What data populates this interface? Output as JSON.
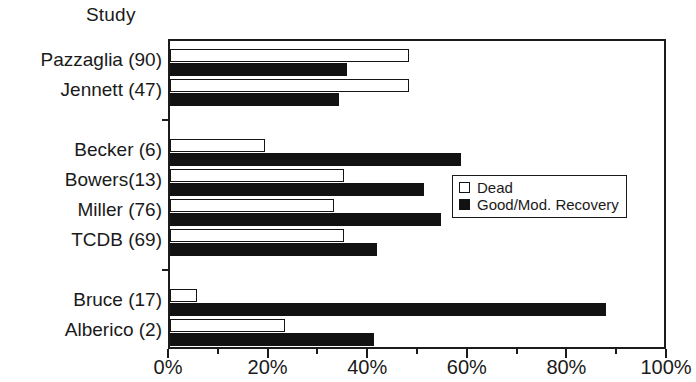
{
  "chart_data": {
    "type": "bar",
    "orientation": "horizontal",
    "title": "",
    "xlabel": "",
    "ylabel": "Study",
    "axis_title": "Study",
    "categories": [
      "Pazzaglia (90)",
      "Jennett (47)",
      "Becker (6)",
      "Bowers(13)",
      "Miller (76)",
      "TCDB (69)",
      "Bruce (17)",
      "Alberico (2)"
    ],
    "series": [
      {
        "name": "Dead",
        "color": "#ffffff",
        "style": "open",
        "values": [
          48,
          48,
          19,
          35,
          33,
          35,
          5.5,
          23
        ]
      },
      {
        "name": "Good/Mod. Recovery",
        "color": "#121212",
        "style": "filled",
        "values": [
          35.5,
          34,
          58.5,
          51,
          54.5,
          41.5,
          87.5,
          41
        ]
      }
    ],
    "xlim": [
      0,
      100
    ],
    "xticks": [
      0,
      20,
      40,
      60,
      80,
      100
    ],
    "xtick_labels": [
      "0%",
      "20%",
      "40%",
      "60%",
      "80%",
      "100%"
    ],
    "xminor_ticks": [
      10,
      30,
      50,
      70,
      90
    ],
    "grid": false,
    "legend": {
      "position": "center-right",
      "entries": [
        {
          "label": "Dead",
          "swatch": "open-square"
        },
        {
          "label": "Good/Mod. Recovery",
          "swatch": "filled-square"
        }
      ]
    },
    "group_breaks_after": [
      "Jennett (47)",
      "TCDB (69)"
    ]
  },
  "colors": {
    "axis": "#1b1b1b",
    "text": "#1a1a1a",
    "dead_fill": "#ffffff",
    "recovery_fill": "#121212",
    "background": "#ffffff"
  }
}
